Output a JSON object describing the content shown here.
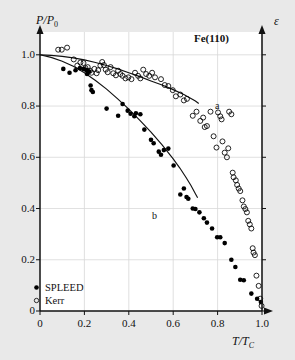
{
  "figure": {
    "sample_label": "Fe(110)",
    "background_color": "#e9e9e9",
    "plot_background_color": "#ffffff"
  },
  "axes": {
    "y_left_title_main": "P/P",
    "y_left_title_sub": "0",
    "y_right_title": "ε",
    "x_title_main": "T/T",
    "x_title_sub": "C",
    "x_ticks": [
      "0",
      "0.2",
      "0.4",
      "0.6",
      "0.8",
      "1.0"
    ],
    "y_ticks": [
      "0",
      "0.2",
      "0.4",
      "0.6",
      "0.8",
      "1.0"
    ]
  },
  "legend": {
    "items": [
      {
        "label": "SPLEED",
        "marker": "filled-circle",
        "color": "#000000"
      },
      {
        "label": "Kerr",
        "marker": "open-circle",
        "color": "#000000"
      }
    ]
  },
  "annotations": [
    {
      "name": "curve-label-a",
      "text": "a"
    },
    {
      "name": "curve-label-b",
      "text": "b"
    }
  ],
  "chart_data": {
    "type": "scatter",
    "title": "",
    "subtitle": "",
    "xlabel": "T/TC",
    "ylabel": "P/P0",
    "y2label": "epsilon",
    "xlim": [
      0,
      1.0
    ],
    "ylim": [
      0,
      1.05
    ],
    "xticks": [
      0,
      0.2,
      0.4,
      0.6,
      0.8,
      1.0
    ],
    "yticks": [
      0,
      0.2,
      0.4,
      0.6,
      0.8,
      1.0
    ],
    "grid": true,
    "legend_position": "bottom-left",
    "annotations": [
      {
        "text": "Fe(110)",
        "x": 0.78,
        "y": 1.0
      },
      {
        "text": "a",
        "x": 0.865,
        "y": 0.785
      },
      {
        "text": "b",
        "x": 0.555,
        "y": 0.375
      }
    ],
    "series": [
      {
        "name": "SPLEED",
        "marker": "filled-circle",
        "color": "#000000",
        "points": [
          [
            0.105,
            0.945
          ],
          [
            0.133,
            0.93
          ],
          [
            0.16,
            0.94
          ],
          [
            0.18,
            0.948
          ],
          [
            0.196,
            0.945
          ],
          [
            0.208,
            0.941
          ],
          [
            0.215,
            0.938
          ],
          [
            0.222,
            0.935
          ],
          [
            0.212,
            0.925
          ],
          [
            0.228,
            0.88
          ],
          [
            0.232,
            0.862
          ],
          [
            0.238,
            0.855
          ],
          [
            0.3,
            0.79
          ],
          [
            0.352,
            0.762
          ],
          [
            0.372,
            0.808
          ],
          [
            0.395,
            0.782
          ],
          [
            0.408,
            0.77
          ],
          [
            0.425,
            0.76
          ],
          [
            0.432,
            0.772
          ],
          [
            0.452,
            0.768
          ],
          [
            0.47,
            0.708
          ],
          [
            0.5,
            0.668
          ],
          [
            0.512,
            0.655
          ],
          [
            0.535,
            0.622
          ],
          [
            0.545,
            0.61
          ],
          [
            0.558,
            0.628
          ],
          [
            0.578,
            0.634
          ],
          [
            0.602,
            0.568
          ],
          [
            0.632,
            0.455
          ],
          [
            0.648,
            0.478
          ],
          [
            0.66,
            0.445
          ],
          [
            0.668,
            0.438
          ],
          [
            0.688,
            0.4
          ],
          [
            0.7,
            0.398
          ],
          [
            0.718,
            0.385
          ],
          [
            0.738,
            0.362
          ],
          [
            0.752,
            0.345
          ],
          [
            0.775,
            0.322
          ],
          [
            0.798,
            0.288
          ],
          [
            0.812,
            0.288
          ],
          [
            0.832,
            0.265
          ],
          [
            0.862,
            0.2
          ],
          [
            0.88,
            0.172
          ],
          [
            0.902,
            0.122
          ],
          [
            0.918,
            0.12
          ],
          [
            0.952,
            0.068
          ],
          [
            0.978,
            0.048
          ],
          [
            0.995,
            0.035
          ]
        ]
      },
      {
        "name": "Kerr",
        "marker": "open-circle",
        "color": "#000000",
        "points": [
          [
            0.082,
            1.02
          ],
          [
            0.098,
            1.02
          ],
          [
            0.122,
            1.028
          ],
          [
            0.152,
            0.982
          ],
          [
            0.168,
            0.958
          ],
          [
            0.182,
            0.97
          ],
          [
            0.196,
            0.968
          ],
          [
            0.205,
            0.948
          ],
          [
            0.215,
            0.952
          ],
          [
            0.225,
            0.938
          ],
          [
            0.232,
            0.93
          ],
          [
            0.245,
            0.945
          ],
          [
            0.255,
            0.928
          ],
          [
            0.262,
            0.94
          ],
          [
            0.272,
            0.958
          ],
          [
            0.28,
            0.972
          ],
          [
            0.288,
            0.96
          ],
          [
            0.296,
            0.942
          ],
          [
            0.305,
            0.932
          ],
          [
            0.318,
            0.952
          ],
          [
            0.33,
            0.928
          ],
          [
            0.342,
            0.92
          ],
          [
            0.352,
            0.938
          ],
          [
            0.362,
            0.925
          ],
          [
            0.372,
            0.918
          ],
          [
            0.385,
            0.908
          ],
          [
            0.398,
            0.912
          ],
          [
            0.412,
            0.905
          ],
          [
            0.428,
            0.93
          ],
          [
            0.442,
            0.918
          ],
          [
            0.452,
            0.908
          ],
          [
            0.465,
            0.942
          ],
          [
            0.478,
            0.925
          ],
          [
            0.492,
            0.918
          ],
          [
            0.505,
            0.93
          ],
          [
            0.518,
            0.912
          ],
          [
            0.545,
            0.905
          ],
          [
            0.562,
            0.882
          ],
          [
            0.578,
            0.878
          ],
          [
            0.598,
            0.862
          ],
          [
            0.612,
            0.838
          ],
          [
            0.632,
            0.845
          ],
          [
            0.648,
            0.822
          ],
          [
            0.662,
            0.828
          ],
          [
            0.688,
            0.762
          ],
          [
            0.705,
            0.778
          ],
          [
            0.722,
            0.742
          ],
          [
            0.735,
            0.755
          ],
          [
            0.742,
            0.718
          ],
          [
            0.752,
            0.722
          ],
          [
            0.768,
            0.778
          ],
          [
            0.782,
            0.682
          ],
          [
            0.795,
            0.638
          ],
          [
            0.802,
            0.775
          ],
          [
            0.812,
            0.76
          ],
          [
            0.818,
            0.748
          ],
          [
            0.822,
            0.662
          ],
          [
            0.832,
            0.618
          ],
          [
            0.842,
            0.6
          ],
          [
            0.848,
            0.635
          ],
          [
            0.852,
            0.778
          ],
          [
            0.862,
            0.768
          ],
          [
            0.868,
            0.54
          ],
          [
            0.872,
            0.522
          ],
          [
            0.882,
            0.51
          ],
          [
            0.888,
            0.492
          ],
          [
            0.895,
            0.478
          ],
          [
            0.902,
            0.468
          ],
          [
            0.912,
            0.432
          ],
          [
            0.918,
            0.408
          ],
          [
            0.925,
            0.398
          ],
          [
            0.932,
            0.385
          ],
          [
            0.938,
            0.352
          ],
          [
            0.945,
            0.338
          ],
          [
            0.952,
            0.322
          ],
          [
            0.958,
            0.245
          ],
          [
            0.962,
            0.228
          ],
          [
            0.968,
            0.218
          ],
          [
            0.975,
            0.138
          ],
          [
            0.985,
            0.098
          ],
          [
            0.992,
            0.048
          ],
          [
            0.998,
            0.02
          ]
        ]
      }
    ],
    "fit_curves": [
      {
        "name": "a",
        "description": "upper fitted curve through Kerr data",
        "points": [
          [
            0.0,
            1.0
          ],
          [
            0.05,
            0.998
          ],
          [
            0.1,
            0.994
          ],
          [
            0.15,
            0.988
          ],
          [
            0.2,
            0.98
          ],
          [
            0.25,
            0.97
          ],
          [
            0.3,
            0.958
          ],
          [
            0.35,
            0.945
          ],
          [
            0.4,
            0.93
          ],
          [
            0.45,
            0.915
          ],
          [
            0.5,
            0.898
          ],
          [
            0.55,
            0.882
          ],
          [
            0.6,
            0.864
          ],
          [
            0.65,
            0.844
          ],
          [
            0.7,
            0.82
          ],
          [
            0.715,
            0.81
          ]
        ]
      },
      {
        "name": "b",
        "description": "lower fitted curve through SPLEED data",
        "points": [
          [
            0.0,
            1.0
          ],
          [
            0.05,
            0.99
          ],
          [
            0.1,
            0.975
          ],
          [
            0.15,
            0.955
          ],
          [
            0.2,
            0.93
          ],
          [
            0.25,
            0.9
          ],
          [
            0.3,
            0.866
          ],
          [
            0.35,
            0.828
          ],
          [
            0.4,
            0.788
          ],
          [
            0.45,
            0.744
          ],
          [
            0.5,
            0.698
          ],
          [
            0.55,
            0.648
          ],
          [
            0.6,
            0.594
          ],
          [
            0.63,
            0.558
          ],
          [
            0.66,
            0.518
          ],
          [
            0.68,
            0.49
          ],
          [
            0.7,
            0.458
          ],
          [
            0.71,
            0.442
          ]
        ]
      }
    ]
  }
}
